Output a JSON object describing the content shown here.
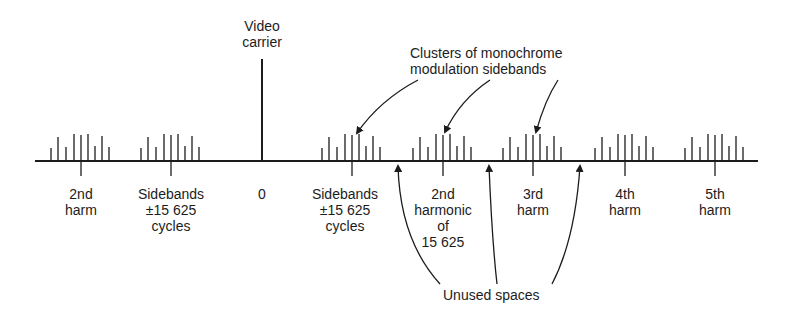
{
  "diagram": {
    "type": "frequency-spectrum",
    "colors": {
      "ink": "#1c1c1c",
      "background": "#ffffff"
    },
    "video_carrier_label": [
      "Video",
      "carrier"
    ],
    "clusters_label": [
      "Clusters of monochrome",
      "modulation sidebands"
    ],
    "unused_label": "Unused spaces",
    "axis_labels": [
      {
        "id": "lower-2nd-harm",
        "lines": [
          "2nd",
          "harm"
        ],
        "x": 81
      },
      {
        "id": "lower-sidebands",
        "lines": [
          "Sidebands",
          "±15 625",
          "cycles"
        ],
        "x": 171
      },
      {
        "id": "zero",
        "lines": [
          "0"
        ],
        "x": 262
      },
      {
        "id": "upper-sidebands",
        "lines": [
          "Sidebands",
          "±15 625",
          "cycles"
        ],
        "x": 345
      },
      {
        "id": "upper-2nd-harmonic",
        "lines": [
          "2nd",
          "harmonic",
          "of",
          "15 625"
        ],
        "x": 443
      },
      {
        "id": "upper-3rd-harm",
        "lines": [
          "3rd",
          "harm"
        ],
        "x": 533
      },
      {
        "id": "upper-4th-harm",
        "lines": [
          "4th",
          "harm"
        ],
        "x": 625
      },
      {
        "id": "upper-5th-harm",
        "lines": [
          "5th",
          "harm"
        ],
        "x": 715
      }
    ],
    "cluster_centers": [
      81,
      171,
      352,
      443,
      533,
      625,
      715
    ],
    "carrier_x": 262
  }
}
